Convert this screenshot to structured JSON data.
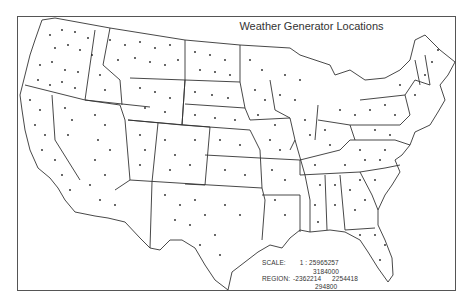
{
  "map": {
    "title": "Weather Generator Locations",
    "subject": "Contiguous United States",
    "marker": "station-dot",
    "line_color": "#333333",
    "background": "#ffffff"
  },
  "legend": {
    "scale_label": "SCALE:",
    "scale_value": "1 : 25965257",
    "region_label": "REGION:",
    "region_top": "3184000",
    "region_left": "-2362214",
    "region_right": "2254418",
    "region_bottom": "294800"
  }
}
